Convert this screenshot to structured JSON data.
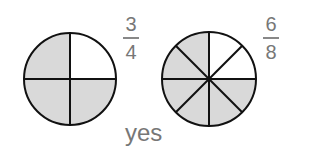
{
  "left": {
    "numerator": "3",
    "denominator": "4",
    "parts": 4,
    "shaded": 3
  },
  "right": {
    "numerator": "6",
    "denominator": "8",
    "parts": 8,
    "shaded": 6
  },
  "answer": "yes",
  "colors": {
    "shade": "#d9d9d9",
    "stroke": "#111111",
    "text": "#777777"
  }
}
